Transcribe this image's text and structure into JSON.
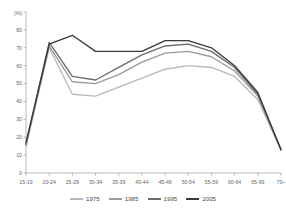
{
  "chart_data": {
    "type": "line",
    "title": "",
    "xlabel": "",
    "ylabel": "",
    "unit_label": "(%)",
    "ylim": [
      0,
      90
    ],
    "yticks": [
      0,
      10,
      20,
      30,
      40,
      50,
      60,
      70,
      80,
      90
    ],
    "grid": false,
    "legend_position": "bottom",
    "categories": [
      "15-19",
      "20-24",
      "25-29",
      "30-34",
      "35-39",
      "40-44",
      "45-49",
      "50-54",
      "55-59",
      "60-64",
      "65-69",
      "70~"
    ],
    "series": [
      {
        "name": "1975",
        "color": "#b9b9b9",
        "values": [
          15,
          70,
          44,
          43,
          48,
          53,
          58,
          60,
          59,
          54,
          41,
          13
        ]
      },
      {
        "name": "1985",
        "color": "#9a9a9a",
        "values": [
          16,
          71,
          51,
          50,
          55,
          62,
          67,
          68,
          65,
          57,
          43,
          13
        ]
      },
      {
        "name": "1995",
        "color": "#6b6b6b",
        "values": [
          16,
          73,
          54,
          52,
          59,
          66,
          71,
          72,
          68,
          59,
          44,
          13
        ]
      },
      {
        "name": "2005",
        "color": "#3a3a3a",
        "values": [
          17,
          72,
          77,
          68,
          68,
          68,
          74,
          74,
          70,
          60,
          45,
          13
        ]
      }
    ]
  },
  "legend": {
    "items": [
      {
        "label": "1975",
        "color": "#b9b9b9"
      },
      {
        "label": "1985",
        "color": "#9a9a9a"
      },
      {
        "label": "1995",
        "color": "#6b6b6b"
      },
      {
        "label": "2005",
        "color": "#3a3a3a"
      }
    ]
  },
  "axis": {
    "y_unit": "(%)",
    "y_tick_labels": [
      "90",
      "80",
      "70",
      "60",
      "50",
      "40",
      "30",
      "20",
      "10",
      "0"
    ],
    "x_tick_labels": [
      "15-19",
      "20-24",
      "25-29",
      "30-34",
      "35-39",
      "40-44",
      "45-49",
      "50-54",
      "55-59",
      "60-64",
      "65-69",
      "70~"
    ]
  }
}
